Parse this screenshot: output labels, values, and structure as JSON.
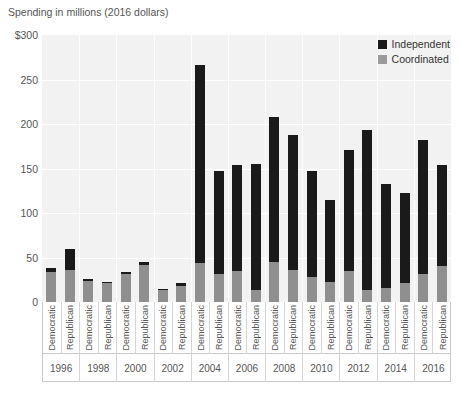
{
  "chart_data": {
    "type": "bar",
    "title": "Spending in millions (2016 dollars)",
    "xlabel": "",
    "ylabel": "Spending in millions (2016 dollars)",
    "ylim": [
      0,
      300
    ],
    "yticks": [
      0,
      50,
      100,
      150,
      200,
      250,
      300
    ],
    "ytick_labels": [
      "0",
      "50",
      "100",
      "150",
      "200",
      "250",
      "$300"
    ],
    "grid": true,
    "stacked": true,
    "legend_position": "top-right",
    "legend": [
      "Independent",
      "Coordinated"
    ],
    "colors": {
      "independent": "#1a1a1a",
      "coordinated": "#8f8f8f",
      "plot_background": "#f2f2f2",
      "gridline": "#ffffff",
      "text": "#555555"
    },
    "years": [
      "1996",
      "1998",
      "2000",
      "2002",
      "2004",
      "2006",
      "2008",
      "2010",
      "2012",
      "2014",
      "2016"
    ],
    "parties": [
      "Democratic",
      "Republican"
    ],
    "categories": [
      "1996 Democratic",
      "1996 Republican",
      "1998 Democratic",
      "1998 Republican",
      "2000 Democratic",
      "2000 Republican",
      "2002 Democratic",
      "2002 Republican",
      "2004 Democratic",
      "2004 Republican",
      "2006 Democratic",
      "2006 Republican",
      "2008 Democratic",
      "2008 Republican",
      "2010 Democratic",
      "2010 Republican",
      "2012 Democratic",
      "2012 Republican",
      "2014 Democratic",
      "2014 Republican",
      "2016 Democratic",
      "2016 Republican"
    ],
    "series": [
      {
        "name": "Coordinated",
        "values": [
          34,
          36,
          24,
          21,
          31,
          42,
          13,
          18,
          44,
          32,
          35,
          14,
          45,
          36,
          28,
          22,
          35,
          14,
          16,
          21,
          32,
          40
        ]
      },
      {
        "name": "Independent",
        "values": [
          4,
          24,
          2,
          2,
          3,
          3,
          2,
          3,
          222,
          115,
          119,
          141,
          163,
          152,
          119,
          93,
          136,
          179,
          117,
          102,
          150,
          114
        ]
      }
    ],
    "totals": [
      38,
      60,
      26,
      23,
      34,
      45,
      15,
      21,
      266,
      147,
      154,
      155,
      208,
      188,
      147,
      115,
      171,
      193,
      133,
      123,
      182,
      154
    ]
  },
  "legend": {
    "independent_label": "Independent",
    "coordinated_label": "Coordinated"
  },
  "axis": {
    "title": "Spending in millions (2016 dollars)"
  }
}
